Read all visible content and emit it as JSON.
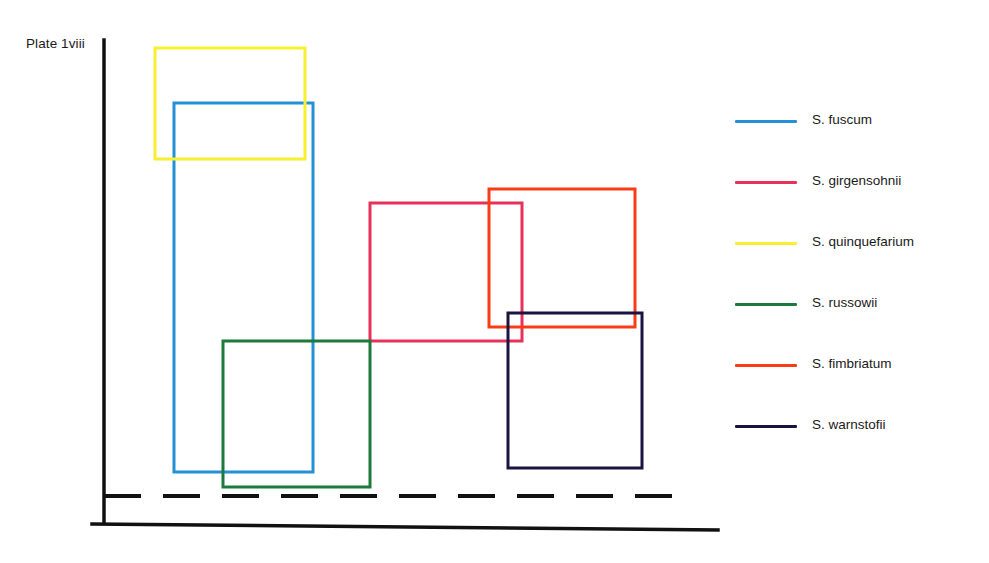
{
  "figure": {
    "plate_label": "Plate 1viii",
    "background": "#ffffff"
  },
  "axes": {
    "y_axis": {
      "x": 104,
      "y_top": 40,
      "y_bottom": 523,
      "color": "#111111",
      "width": 3.5
    },
    "x_axis": {
      "x_start": 92,
      "y_start": 524,
      "x_end": 718,
      "y_end": 530,
      "color": "#111111",
      "width": 3.5
    },
    "dashed_baseline": {
      "y": 496,
      "x_start": 104,
      "x_end": 685,
      "color": "#111111",
      "width": 4,
      "dash": "37 22"
    }
  },
  "chart_data": {
    "type": "box-overlap",
    "title": "Plate 1viii",
    "xlabel": "",
    "ylabel": "",
    "grid": false,
    "legend_position": "right",
    "note": "Overlapping open rectangles, one per Sphagnum species, plotted in pixel coordinates of the figure panel.",
    "series": [
      {
        "name": "S. fuscum",
        "color": "#2491d6",
        "rect": {
          "x": 174,
          "y": 103,
          "width": 139,
          "height": 369
        },
        "bounds": {
          "left": 174,
          "top": 103,
          "right": 313,
          "bottom": 472
        }
      },
      {
        "name": "S. girgensohnii",
        "color": "#e8315a",
        "rect": {
          "x": 370,
          "y": 203,
          "width": 152,
          "height": 138
        },
        "bounds": {
          "left": 370,
          "top": 203,
          "right": 522,
          "bottom": 341
        }
      },
      {
        "name": "S. quinquefarium",
        "color": "#f7ef31",
        "rect": {
          "x": 155,
          "y": 48,
          "width": 150,
          "height": 111
        },
        "bounds": {
          "left": 155,
          "top": 48,
          "right": 305,
          "bottom": 159
        }
      },
      {
        "name": "S. russowii",
        "color": "#1d7a3c",
        "rect": {
          "x": 223,
          "y": 341,
          "width": 147,
          "height": 146
        },
        "bounds": {
          "left": 223,
          "top": 341,
          "right": 370,
          "bottom": 487
        }
      },
      {
        "name": "S. fimbriatum",
        "color": "#f93c16",
        "rect": {
          "x": 489,
          "y": 189,
          "width": 146,
          "height": 138
        },
        "bounds": {
          "left": 489,
          "top": 189,
          "right": 635,
          "bottom": 327
        }
      },
      {
        "name": "S. warnstofii",
        "color": "#1b1340",
        "rect": {
          "x": 508,
          "y": 313,
          "width": 134,
          "height": 155
        },
        "bounds": {
          "left": 508,
          "top": 313,
          "right": 642,
          "bottom": 468
        }
      }
    ]
  },
  "legend": {
    "items": [
      {
        "label": "S. fuscum",
        "color": "#2491d6"
      },
      {
        "label": "S. girgensohnii",
        "color": "#e8315a"
      },
      {
        "label": "S. quinquefarium",
        "color": "#f7ef31"
      },
      {
        "label": "S. russowii",
        "color": "#1d7a3c"
      },
      {
        "label": "S. fimbriatum",
        "color": "#f93c16"
      },
      {
        "label": "S. warnstofii",
        "color": "#1b1340"
      }
    ]
  }
}
